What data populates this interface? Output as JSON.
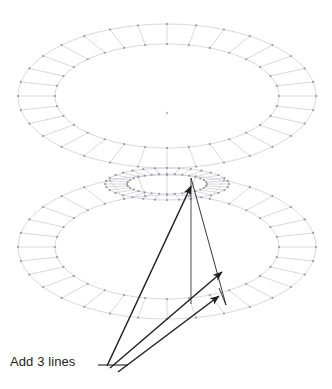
{
  "figure": {
    "title": "Add 3 lines",
    "background_color": "#ffffff",
    "width": 332,
    "height": 389
  },
  "annotation": {
    "label": "Add 3 lines",
    "label_color": "#231f20",
    "leader_line": {
      "from_x": 98,
      "from_y": 365,
      "to_x": 128,
      "to_y": 365
    }
  },
  "mesh": {
    "line_color": "#c9c9cf",
    "vertex_color": "#9a9aa5",
    "center_dot_color": "#bdbdc4",
    "radial_segments": 32,
    "rings": [
      {
        "name": "upper-annulus",
        "center_x": 167,
        "center_y": 96,
        "outer_rx": 149,
        "outer_ry": 72,
        "inner_rx": 112,
        "inner_ry": 52,
        "tilt_y": 0
      },
      {
        "name": "lower-annulus",
        "center_x": 167,
        "center_y": 247,
        "outer_rx": 149,
        "outer_ry": 72,
        "inner_rx": 112,
        "inner_ry": 52,
        "tilt_y": 0
      },
      {
        "name": "lower-inner-hub",
        "center_x": 167,
        "center_y": 184,
        "outer_rx": 62,
        "outer_ry": 16,
        "inner_rx": 40,
        "inner_ry": 10,
        "tilt_y": 0
      }
    ],
    "center_marker": {
      "x": 167,
      "y": 113
    }
  },
  "vectors": {
    "color": "#231f20",
    "stroke_width": 1.5,
    "origin": {
      "x": 107,
      "y": 366
    },
    "arrows": [
      {
        "name": "arrow-to-hub-top",
        "x1": 107,
        "y1": 366,
        "x2": 191,
        "y2": 186,
        "label": ""
      },
      {
        "name": "arrow-to-mid-right",
        "x1": 110,
        "y1": 368,
        "x2": 222,
        "y2": 272,
        "label": ""
      },
      {
        "name": "arrow-to-lower-right",
        "x1": 118,
        "y1": 372,
        "x2": 219,
        "y2": 296,
        "label": ""
      }
    ],
    "axis_line": {
      "name": "vertical-axis",
      "x1": 191,
      "y1": 178,
      "x2": 191,
      "y2": 304
    },
    "edge_lines": [
      {
        "name": "edge-hub-to-base-right",
        "x1": 191,
        "y1": 178,
        "x2": 226,
        "y2": 305
      },
      {
        "name": "edge-base-right-vertical",
        "x1": 226,
        "y1": 305,
        "x2": 219,
        "y2": 288
      }
    ]
  }
}
